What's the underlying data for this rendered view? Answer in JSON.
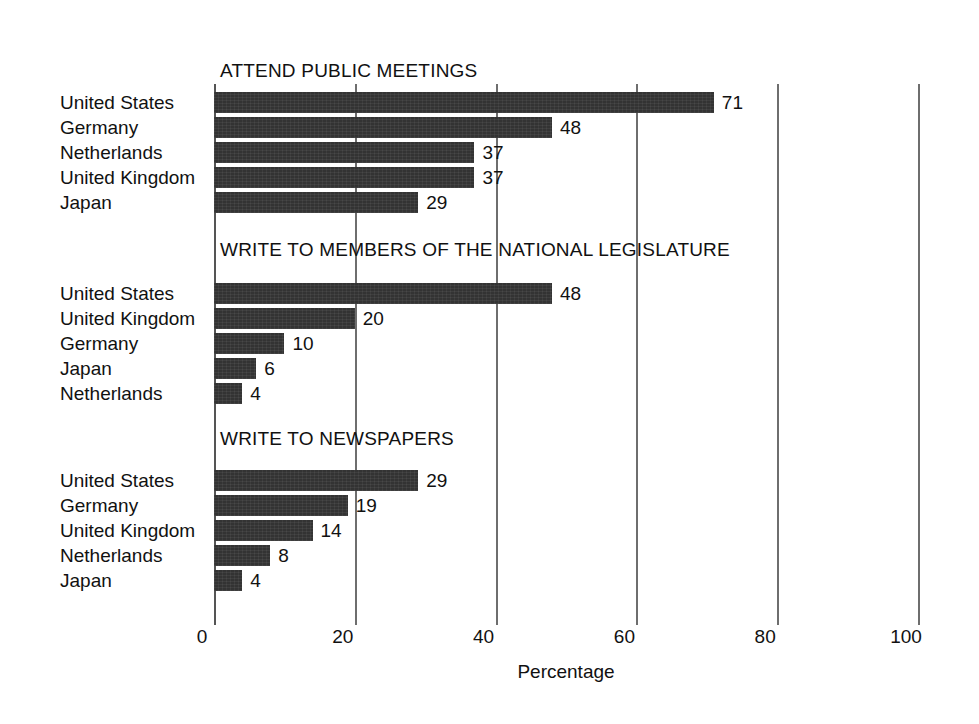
{
  "chart_data": {
    "type": "bar",
    "orientation": "horizontal",
    "title": "",
    "xlabel": "Percentage",
    "ylabel": "",
    "xlim": [
      0,
      100
    ],
    "xticks": [
      0,
      20,
      40,
      60,
      80,
      100
    ],
    "xtick_labels": [
      "0",
      "20",
      "40",
      "60",
      "80",
      "100"
    ],
    "grid": true,
    "legend": null,
    "bar_color": "#333333",
    "groups": [
      {
        "title": "ATTEND PUBLIC MEETINGS",
        "categories": [
          "United States",
          "Germany",
          "Netherlands",
          "United Kingdom",
          "Japan"
        ],
        "values": [
          71,
          48,
          37,
          37,
          29
        ],
        "value_labels": [
          "71",
          "48",
          "37",
          "37",
          "29"
        ]
      },
      {
        "title": "WRITE TO MEMBERS OF THE NATIONAL LEGISLATURE",
        "categories": [
          "United States",
          "United Kingdom",
          "Germany",
          "Japan",
          "Netherlands"
        ],
        "values": [
          48,
          20,
          10,
          6,
          4
        ],
        "value_labels": [
          "48",
          "20",
          "10",
          "6",
          "4"
        ]
      },
      {
        "title": "WRITE TO NEWSPAPERS",
        "categories": [
          "United States",
          "Germany",
          "United Kingdom",
          "Netherlands",
          "Japan"
        ],
        "values": [
          29,
          19,
          14,
          8,
          4
        ],
        "value_labels": [
          "29",
          "19",
          "14",
          "8",
          "4"
        ]
      }
    ]
  }
}
